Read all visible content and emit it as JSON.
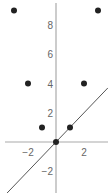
{
  "chart_data": {
    "type": "scatter",
    "title": "",
    "xlabel": "",
    "ylabel": "",
    "xlim": [
      -4,
      4
    ],
    "ylim": [
      -3.5,
      9.8
    ],
    "grid": false,
    "x_ticks": [
      -2,
      2
    ],
    "y_ticks": [
      -2,
      2,
      4,
      6,
      8
    ],
    "series": [
      {
        "name": "points",
        "type": "scatter",
        "x": [
          -3,
          3,
          -2,
          2,
          -1,
          1,
          0
        ],
        "y": [
          9,
          9,
          4,
          4,
          1,
          1,
          0
        ]
      },
      {
        "name": "line y=x",
        "type": "line",
        "x": [
          -3.5,
          3.7
        ],
        "y": [
          -3.5,
          3.7
        ]
      }
    ]
  },
  "colors": {
    "axis": "#aaaaaa",
    "point": "#222222",
    "line": "#555555",
    "label": "#666666"
  }
}
